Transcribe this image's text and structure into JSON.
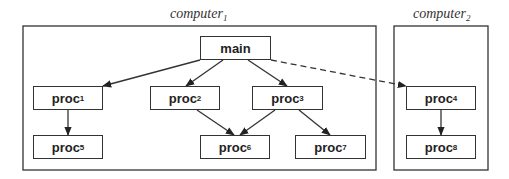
{
  "groups": [
    {
      "id": "computer1",
      "label": "computer",
      "sub": "1",
      "x": 23,
      "y": 26,
      "w": 353,
      "h": 144,
      "label_x": 170,
      "label_y": 6
    },
    {
      "id": "computer2",
      "label": "computer",
      "sub": "2",
      "x": 394,
      "y": 26,
      "w": 94,
      "h": 144,
      "label_x": 413,
      "label_y": 6
    }
  ],
  "nodes": [
    {
      "id": "main",
      "label": "main",
      "sub": "",
      "x": 200,
      "y": 36,
      "w": 71,
      "h": 24
    },
    {
      "id": "proc1",
      "label": "proc",
      "sub": "1",
      "x": 33,
      "y": 86,
      "w": 70,
      "h": 24
    },
    {
      "id": "proc2",
      "label": "proc",
      "sub": "2",
      "x": 150,
      "y": 86,
      "w": 70,
      "h": 24
    },
    {
      "id": "proc3",
      "label": "proc",
      "sub": "3",
      "x": 252,
      "y": 86,
      "w": 71,
      "h": 24
    },
    {
      "id": "proc4",
      "label": "proc",
      "sub": "4",
      "x": 406,
      "y": 86,
      "w": 70,
      "h": 24
    },
    {
      "id": "proc5",
      "label": "proc",
      "sub": "5",
      "x": 33,
      "y": 135,
      "w": 70,
      "h": 24
    },
    {
      "id": "proc6",
      "label": "proc",
      "sub": "6",
      "x": 200,
      "y": 135,
      "w": 70,
      "h": 24
    },
    {
      "id": "proc7",
      "label": "proc",
      "sub": "7",
      "x": 295,
      "y": 135,
      "w": 71,
      "h": 24
    },
    {
      "id": "proc8",
      "label": "proc",
      "sub": "8",
      "x": 406,
      "y": 135,
      "w": 70,
      "h": 24
    }
  ],
  "edges": [
    {
      "from": "main",
      "to": "proc1",
      "style": "solid",
      "x1": 200,
      "y1": 60,
      "x2": 103,
      "y2": 86
    },
    {
      "from": "main",
      "to": "proc2",
      "style": "solid",
      "x1": 223,
      "y1": 60,
      "x2": 186,
      "y2": 86
    },
    {
      "from": "main",
      "to": "proc3",
      "style": "solid",
      "x1": 248,
      "y1": 60,
      "x2": 287,
      "y2": 86
    },
    {
      "from": "main",
      "to": "proc4",
      "style": "dashed",
      "x1": 271,
      "y1": 60,
      "x2": 406,
      "y2": 86
    },
    {
      "from": "proc1",
      "to": "proc5",
      "style": "solid",
      "x1": 68,
      "y1": 110,
      "x2": 68,
      "y2": 135
    },
    {
      "from": "proc2",
      "to": "proc6",
      "style": "solid",
      "x1": 197,
      "y1": 110,
      "x2": 234,
      "y2": 135
    },
    {
      "from": "proc3",
      "to": "proc6",
      "style": "solid",
      "x1": 275,
      "y1": 110,
      "x2": 240,
      "y2": 135
    },
    {
      "from": "proc3",
      "to": "proc7",
      "style": "solid",
      "x1": 299,
      "y1": 110,
      "x2": 330,
      "y2": 135
    },
    {
      "from": "proc4",
      "to": "proc8",
      "style": "solid",
      "x1": 441,
      "y1": 110,
      "x2": 441,
      "y2": 135
    }
  ],
  "colors": {
    "stroke": "#333333",
    "text": "#222222",
    "background": "#ffffff"
  }
}
